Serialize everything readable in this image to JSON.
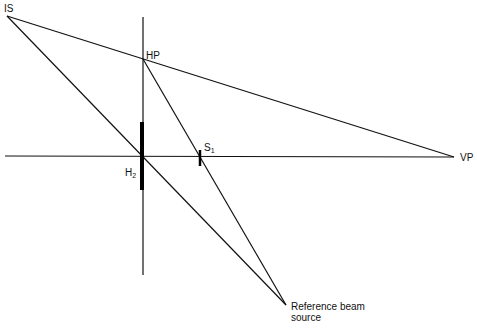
{
  "diagram": {
    "labels": {
      "IS": "IS",
      "HP": "HP",
      "S1_main": "S",
      "S1_sub": "1",
      "H2_main": "H",
      "H2_sub": "2",
      "VP": "VP",
      "reference_line1": "Reference beam",
      "reference_line2": "source"
    },
    "points": {
      "IS": [
        7,
        16
      ],
      "HP": [
        143,
        59
      ],
      "VP": [
        454,
        157
      ],
      "H2": [
        143,
        156
      ],
      "S1": [
        200,
        157
      ],
      "reference_beam_source": [
        286,
        305
      ]
    },
    "colors": {
      "line": "#111111",
      "background": "#ffffff"
    }
  }
}
